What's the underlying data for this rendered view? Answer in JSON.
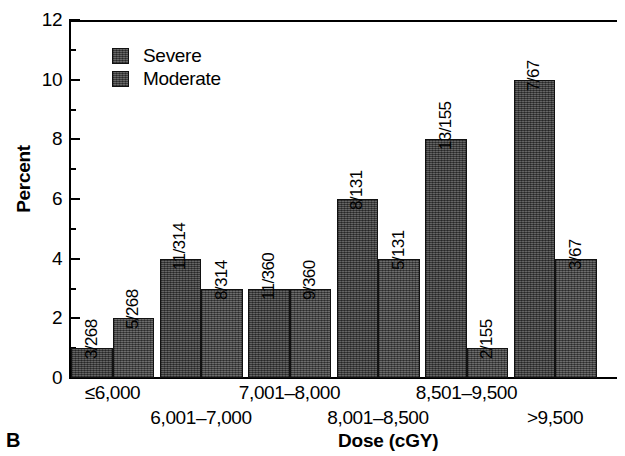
{
  "panel": {
    "letter": "B"
  },
  "axes": {
    "y_title": "Percent",
    "x_title": "Dose (cGY)",
    "y_ticks": [
      "0",
      "2",
      "4",
      "6",
      "8",
      "10",
      "12"
    ],
    "y_minor_ticks": [
      1,
      3,
      5,
      7,
      9,
      11
    ]
  },
  "legend": {
    "items": [
      {
        "label": "Severe",
        "swatch": "dark-gray-hatch"
      },
      {
        "label": "Moderate",
        "swatch": "dark-gray-hatch"
      }
    ]
  },
  "chart_data": {
    "type": "bar",
    "title": "",
    "xlabel": "Dose (cGY)",
    "ylabel": "Percent",
    "ylim": [
      0,
      12
    ],
    "ytick_step": 2,
    "grid": false,
    "legend_position": "top-left-inside",
    "categories": [
      "≤6,000",
      "6,001–7,000",
      "7,001–8,000",
      "8,001–8,500",
      "8,501–9,500",
      ">9,500"
    ],
    "series": [
      {
        "name": "Severe",
        "values": [
          1,
          4,
          3,
          6,
          8,
          10
        ],
        "point_labels": [
          "3/268",
          "11/314",
          "11/360",
          "8/131",
          "13/155",
          "7/67"
        ]
      },
      {
        "name": "Moderate",
        "values": [
          2,
          3,
          3,
          4,
          1,
          4
        ],
        "point_labels": [
          "5/268",
          "8/314",
          "9/360",
          "5/131",
          "2/155",
          "3/67"
        ]
      }
    ]
  }
}
